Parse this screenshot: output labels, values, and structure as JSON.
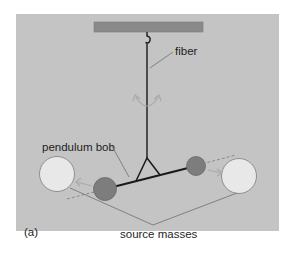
{
  "figure": {
    "panel_label": "(a)",
    "labels": {
      "fiber": "fiber",
      "pendulum_bob": "pendulum bob",
      "source_masses": "source masses"
    },
    "colors": {
      "background": "#ffffff",
      "panel": "#c4c4c4",
      "ceiling_bar": "#8a8a8a",
      "fiber_line": "#1a1a1a",
      "bob_fill": "#7d7d7d",
      "bob_stroke": "#6a6a6a",
      "source_mass_fill": "#e8e8e8",
      "source_mass_stroke": "#8e8e8e",
      "leader_line": "#6e6e6e",
      "arrow": "#a9a9a9",
      "text": "#1e1e1e"
    },
    "components": [
      "ceiling support bar",
      "hook",
      "torsion fiber",
      "rotation arrows",
      "triangular yoke",
      "torsion rod",
      "pendulum bob (left)",
      "pendulum bob (right)",
      "source mass (left)",
      "source mass (right)",
      "motion arrows toward source masses",
      "dashed axis line"
    ]
  }
}
